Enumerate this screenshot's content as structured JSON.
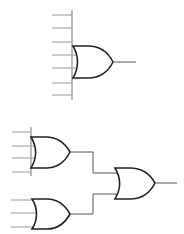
{
  "diagram": {
    "type": "logic-circuit",
    "colors": {
      "gate_stroke": "#222222",
      "wire": "#555555",
      "input_wire": "#9a9a9a",
      "background": "#ffffff"
    },
    "top_circuit": {
      "description": "Single 7-input OR gate",
      "gate": {
        "type": "OR",
        "inputs": 7,
        "left": 73,
        "top": 46,
        "bottom": 78,
        "tip_x": 113,
        "output_end_x": 136
      },
      "bus_x": 72,
      "bus_y": [
        10,
        100
      ],
      "input_y": [
        15,
        28,
        42,
        55,
        68,
        83,
        95
      ],
      "input_x_start": 52
    },
    "bottom_circuit": {
      "description": "Two OR gates (4-input and 3-input) feeding a 2-input OR gate",
      "gates": [
        {
          "id": "or-a",
          "type": "OR",
          "inputs": 4,
          "left": 31,
          "top": 137,
          "bottom": 168,
          "tip_x": 70,
          "input_y": [
            132,
            146,
            158,
            172
          ]
        },
        {
          "id": "or-b",
          "type": "OR",
          "inputs": 3,
          "left": 32,
          "top": 199,
          "bottom": 229,
          "tip_x": 70,
          "input_y": [
            200,
            213,
            227
          ]
        },
        {
          "id": "or-c",
          "type": "OR",
          "inputs": 2,
          "left": 115,
          "top": 168,
          "bottom": 199,
          "tip_x": 155,
          "output_end_x": 177
        }
      ]
    }
  }
}
